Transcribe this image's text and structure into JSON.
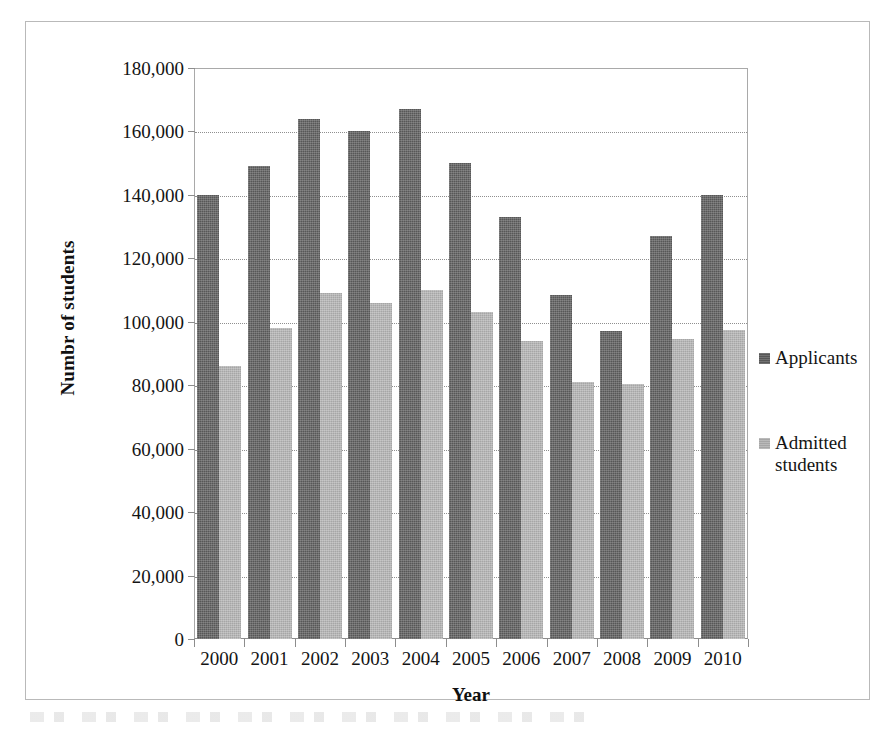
{
  "chart_data": {
    "type": "bar",
    "title": "",
    "xlabel": "Year",
    "ylabel": "Numbr of students",
    "ylim": [
      0,
      180000
    ],
    "ytick_step": 20000,
    "grid": true,
    "legend_position": "right",
    "categories": [
      "2000",
      "2001",
      "2002",
      "2003",
      "2004",
      "2005",
      "2006",
      "2007",
      "2008",
      "2009",
      "2010"
    ],
    "ytick_labels": [
      "0",
      "20,000",
      "40,000",
      "60,000",
      "80,000",
      "100,000",
      "120,000",
      "140,000",
      "160,000",
      "180,000"
    ],
    "ytick_values": [
      0,
      20000,
      40000,
      60000,
      80000,
      100000,
      120000,
      140000,
      160000,
      180000
    ],
    "series": [
      {
        "name": "Applicants",
        "color": "#575757",
        "values": [
          140000,
          149000,
          164000,
          160000,
          167000,
          150000,
          133000,
          108500,
          97000,
          127000,
          140000
        ]
      },
      {
        "name": "Admitted students",
        "color": "#a6a6a6",
        "values": [
          86000,
          98000,
          109000,
          106000,
          110000,
          103000,
          94000,
          81000,
          80500,
          94500,
          97500
        ]
      }
    ]
  },
  "legend": {
    "entries": [
      {
        "label": "Applicants",
        "swatch": "dark"
      },
      {
        "label": "Admitted students",
        "swatch": "light"
      }
    ]
  },
  "axes": {
    "x_title": "Year",
    "y_title": "Numbr of students"
  }
}
